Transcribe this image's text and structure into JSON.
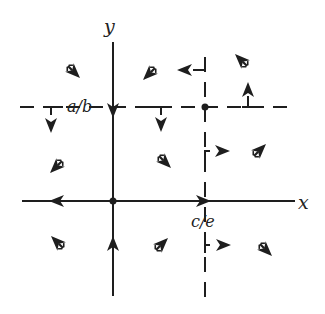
{
  "diagram": {
    "type": "phase-portrait",
    "colors": {
      "ink": "#1e1e1e",
      "background": "#ffffff"
    },
    "axes": {
      "x_label": "x",
      "y_label": "y"
    },
    "labels": {
      "nullcline_h": "a/b",
      "nullcline_v": "c/e"
    },
    "equilibria": [
      {
        "name": "origin",
        "x": 113,
        "y": 201
      },
      {
        "name": "interior",
        "x": 205,
        "y": 107
      }
    ],
    "arrows": [
      {
        "region": "upper-left-of-y",
        "x": 72,
        "y": 70,
        "dir": "down-right"
      },
      {
        "region": "upper-right-of-y",
        "x": 152,
        "y": 70,
        "dir": "down-left"
      },
      {
        "region": "top-nullcline-v",
        "x": 190,
        "y": 70,
        "dir": "left"
      },
      {
        "region": "top-right",
        "x": 243,
        "y": 65,
        "dir": "up-left"
      },
      {
        "region": "on-h-nullcline-right",
        "x": 248,
        "y": 95,
        "dir": "up"
      },
      {
        "region": "on-h-nullcline-left",
        "x": 52,
        "y": 118,
        "dir": "down"
      },
      {
        "region": "on-y-axis-upper",
        "x": 113,
        "y": 112,
        "dir": "down"
      },
      {
        "region": "on-h-nullcline-mid",
        "x": 162,
        "y": 118,
        "dir": "down"
      },
      {
        "region": "middle-left",
        "x": 60,
        "y": 165,
        "dir": "down-left"
      },
      {
        "region": "middle-center",
        "x": 162,
        "y": 160,
        "dir": "down-right"
      },
      {
        "region": "on-v-nullcline-mid",
        "x": 218,
        "y": 152,
        "dir": "right"
      },
      {
        "region": "middle-right",
        "x": 258,
        "y": 152,
        "dir": "up-right"
      },
      {
        "region": "on-x-axis-left",
        "x": 60,
        "y": 201,
        "dir": "left"
      },
      {
        "region": "on-x-axis-right",
        "x": 205,
        "y": 201,
        "dir": "right"
      },
      {
        "region": "lower-left",
        "x": 60,
        "y": 245,
        "dir": "up-left"
      },
      {
        "region": "on-y-axis-lower",
        "x": 113,
        "y": 245,
        "dir": "up"
      },
      {
        "region": "lower-center",
        "x": 157,
        "y": 245,
        "dir": "up-right"
      },
      {
        "region": "on-v-nullcline-lower",
        "x": 218,
        "y": 246,
        "dir": "right"
      },
      {
        "region": "lower-right",
        "x": 262,
        "y": 246,
        "dir": "down-right"
      }
    ]
  }
}
